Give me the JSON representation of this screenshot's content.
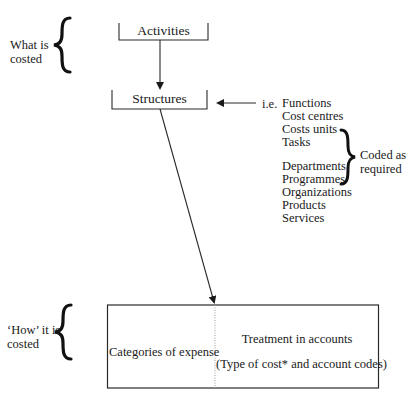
{
  "diagram": {
    "left_labels": {
      "what_is_costed": [
        "What is",
        "costed"
      ],
      "how_it_is_costed": [
        "‘How’ it is",
        "costed"
      ]
    },
    "nodes": {
      "activities": "Activities",
      "structures": "Structures"
    },
    "ie_prefix": "i.e.",
    "structure_examples": [
      "Functions",
      "Cost centres",
      "Costs units",
      "Tasks",
      "",
      "Departments",
      "Programmes",
      "Organizations",
      "Products",
      "Services"
    ],
    "coded_note": [
      "Coded as",
      "required"
    ],
    "bottom_box": {
      "left_cell": "Categories of expense",
      "right_cell_title": "Treatment in accounts",
      "right_cell_sub": "(Type of cost* and account codes)"
    },
    "colors": {
      "line": "#2a2a2a",
      "text": "#1a1a1a",
      "divider": "#9a9a9a",
      "background": "#ffffff"
    }
  }
}
